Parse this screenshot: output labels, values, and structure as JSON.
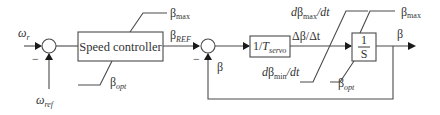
{
  "diagram": {
    "blocks": {
      "speed_controller": {
        "label": "Speed controller"
      },
      "servo": {
        "label_prefix": "1/",
        "label_var": "T",
        "label_sub": "servo"
      },
      "integrator": {
        "numerator": "1",
        "denominator": "S"
      }
    },
    "signals": {
      "omega_r": {
        "base": "ω",
        "sub": "r"
      },
      "omega_ref": {
        "base": "ω",
        "sub": "ref"
      },
      "beta_ref": {
        "base": "β",
        "sub": "REF"
      },
      "beta_feedback": {
        "label": "β"
      },
      "beta_output": {
        "label": "β"
      },
      "delta_beta": {
        "label": "Δβ/Δt"
      }
    },
    "limits": {
      "controller_max": {
        "base": "β",
        "sub": "max"
      },
      "controller_min": {
        "base": "β",
        "sub": "opt"
      },
      "rate_max": {
        "prefix": "d",
        "base": "β",
        "sub": "max",
        "suffix": "/dt"
      },
      "rate_min": {
        "prefix": "d",
        "base": "β",
        "sub": "min",
        "suffix": "/dt"
      },
      "integrator_max": {
        "base": "β",
        "sub": "max"
      },
      "integrator_min": {
        "base": "β",
        "sub": "opt"
      }
    },
    "summing_junctions": [
      {
        "id": "speed-error",
        "minus_sign": "−"
      },
      {
        "id": "pitch-error",
        "minus_sign": "−"
      }
    ]
  }
}
